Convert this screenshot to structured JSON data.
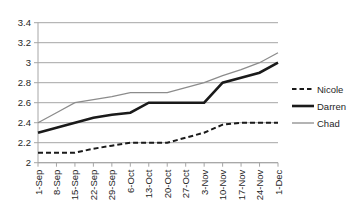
{
  "chart_data": {
    "type": "line",
    "title": "",
    "xlabel": "",
    "ylabel": "",
    "grid": true,
    "categories": [
      "1-Sep",
      "8-Sep",
      "15-Sep",
      "22-Sep",
      "29-Sep",
      "6-Oct",
      "13-Oct",
      "20-Oct",
      "27-Oct",
      "3-Nov",
      "10-Nov",
      "17-Nov",
      "24-Nov",
      "1-Dec"
    ],
    "series": [
      {
        "name": "Nicole",
        "line_style": "dashed",
        "color": "#1a1a1a",
        "stroke_width": 2,
        "values": [
          2.1,
          2.1,
          2.1,
          2.14,
          2.17,
          2.2,
          2.2,
          2.2,
          2.25,
          2.3,
          2.38,
          2.4,
          2.4,
          2.4
        ]
      },
      {
        "name": "Darren",
        "line_style": "solid",
        "color": "#1a1a1a",
        "stroke_width": 2.6,
        "values": [
          2.3,
          2.35,
          2.4,
          2.45,
          2.48,
          2.5,
          2.6,
          2.6,
          2.6,
          2.6,
          2.8,
          2.85,
          2.9,
          3.0
        ]
      },
      {
        "name": "Chad",
        "line_style": "solid",
        "color": "#8c8c8c",
        "stroke_width": 1.3,
        "values": [
          2.4,
          2.5,
          2.6,
          2.63,
          2.66,
          2.7,
          2.7,
          2.7,
          2.75,
          2.8,
          2.87,
          2.93,
          3.0,
          3.1
        ]
      }
    ],
    "y_axis": {
      "min": 2,
      "max": 3.4,
      "step": 0.2,
      "tick_labels": [
        "2",
        "2.2",
        "2.4",
        "2.6",
        "2.8",
        "3",
        "3.2",
        "3.4"
      ]
    },
    "x_axis": {
      "label_rotation": -90
    },
    "legend": {
      "position": "right",
      "entries": [
        "Nicole",
        "Darren",
        "Chad"
      ]
    }
  },
  "colors": {
    "background": "#ffffff",
    "gridline": "#a6a6a6",
    "axis": "#a6a6a6",
    "text": "#262626"
  }
}
